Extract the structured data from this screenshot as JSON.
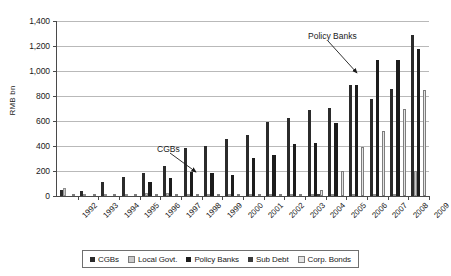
{
  "chart_data": {
    "type": "bar",
    "title": "",
    "xlabel": "",
    "ylabel": "RMB bn",
    "ylim": [
      0,
      1400
    ],
    "ytick_labels": [
      "1,400",
      "1,200",
      "1,000",
      "800",
      "600",
      "400",
      "200",
      "0"
    ],
    "ytick_values": [
      1400,
      1200,
      1000,
      800,
      600,
      400,
      200,
      0
    ],
    "grid": true,
    "legend_position": "bottom",
    "categories": [
      "1992",
      "1993",
      "1994",
      "1995",
      "1996",
      "1997",
      "1998",
      "1999",
      "2000",
      "2001",
      "2002",
      "2003",
      "2004",
      "2005",
      "2006",
      "2007",
      "2008",
      "2009"
    ],
    "series": [
      {
        "name": "CGBs",
        "color": "#2b2b2b",
        "values": [
          46,
          38,
          113,
          151,
          185,
          242,
          381,
          401,
          457,
          488,
          593,
          628,
          692,
          704,
          888,
          780,
          855,
          1289
        ]
      },
      {
        "name": "Local Govt.",
        "color": "#c9c9c9",
        "values": [
          66,
          18,
          16,
          12,
          28,
          22,
          16,
          14,
          12,
          10,
          12,
          10,
          12,
          10,
          12,
          12,
          10,
          200
        ]
      },
      {
        "name": "Policy Banks",
        "color": "#1c1c1c",
        "values": [
          0,
          0,
          0,
          0,
          110,
          145,
          196,
          181,
          165,
          305,
          326,
          420,
          425,
          585,
          890,
          1090,
          1085,
          1180
        ]
      },
      {
        "name": "Sub Debt",
        "color": "#3b3b3b",
        "values": [
          0,
          0,
          0,
          0,
          0,
          0,
          0,
          0,
          0,
          0,
          0,
          0,
          20,
          0,
          0,
          0,
          0,
          0
        ]
      },
      {
        "name": "Corp. Bonds",
        "color": "#e4e4e4",
        "values": [
          0,
          0,
          0,
          0,
          0,
          0,
          0,
          0,
          0,
          0,
          0,
          0,
          52,
          200,
          396,
          518,
          700,
          845
        ]
      }
    ],
    "annotations": [
      {
        "label": "CGBs",
        "text_x": 157,
        "text_y": 144,
        "arrow_x1": 170,
        "arrow_y1": 153,
        "arrow_x2": 196,
        "arrow_y2": 172
      },
      {
        "label": "Policy Banks",
        "text_x": 308,
        "text_y": 31,
        "arrow_x1": 328,
        "arrow_y1": 41,
        "arrow_x2": 357,
        "arrow_y2": 73
      }
    ]
  },
  "legend": {
    "items": [
      {
        "label": "CGBs"
      },
      {
        "label": "Local Govt."
      },
      {
        "label": "Policy Banks"
      },
      {
        "label": "Sub Debt"
      },
      {
        "label": "Corp. Bonds"
      }
    ]
  }
}
